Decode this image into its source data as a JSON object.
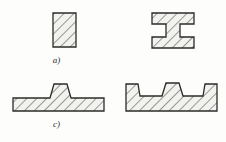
{
  "figure": {
    "background_color": "#fdfdfb",
    "line_color": "#2b2b2b",
    "hatch_color": "#4a4a4a",
    "fill_color": "#f2f2ef",
    "hatch_angle_degrees": 45,
    "caption_style": "italic-serif",
    "parts": [
      {
        "id": "a",
        "label": "a)",
        "shape_name": "rectangular-bar-section",
        "description": "plain rectangular cross-section",
        "outline_points": "6,3 29,3 29,37 6,37"
      },
      {
        "id": "b",
        "label": "b)",
        "shape_name": "i-beam-section",
        "description": "I-shaped section with top and bottom flanges and central web",
        "outline_points": "3,2 45,2 45,13 31,13 31,26 45,26 45,37 3,37 3,26 17,26 17,13 3,13"
      },
      {
        "id": "c",
        "label": "c)",
        "shape_name": "flat-plate-with-central-rib-section",
        "description": "flat plate with one central trapezoidal raised rib",
        "outline_points": "4,22 4,35 95,35 95,22 62,22 58,8 45,8 41,22"
      },
      {
        "id": "d",
        "label": "d)",
        "shape_name": "channel-tray-with-central-rib-section",
        "description": "tray profile with raised side walls and a taller central trapezoidal rib",
        "outline_points": "4,6 16,6 18,18 40,18 44,5 57,5 61,18 81,18 83,6 95,6 95,33 4,33"
      }
    ]
  }
}
